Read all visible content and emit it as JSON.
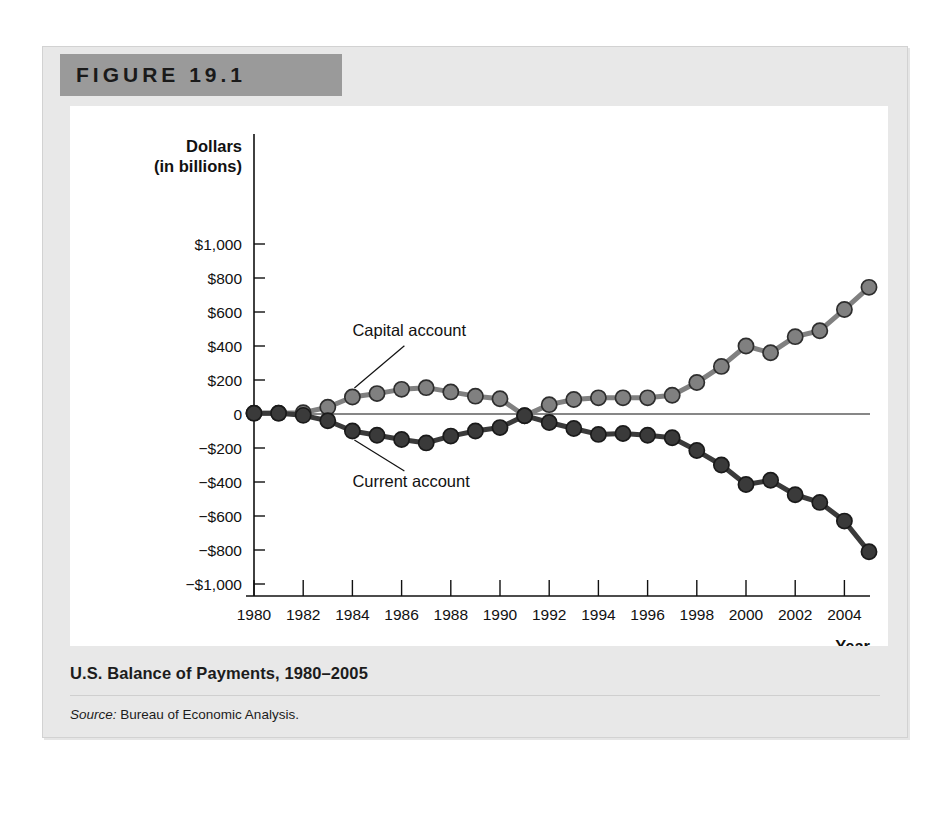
{
  "figure": {
    "header_label": "FIGURE 19.1",
    "caption_title": "U.S. Balance of Payments, 1980–2005",
    "source_prefix": "Source:",
    "source_text": "Bureau of Economic Analysis."
  },
  "chart_data": {
    "type": "line",
    "title": "U.S. Balance of Payments, 1980–2005",
    "xlabel": "Year",
    "ylabel": "Dollars (in billions)",
    "ylabel_line1": "Dollars",
    "ylabel_line2": "(in billions)",
    "xlim": [
      1980,
      2005
    ],
    "ylim": [
      -1000,
      1000
    ],
    "grid": false,
    "legend_position": "inline-annotations",
    "y_ticks": [
      1000,
      800,
      600,
      400,
      200,
      0,
      -200,
      -400,
      -600,
      -800,
      -1000
    ],
    "y_tick_labels": [
      "$1,000",
      "$800",
      "$600",
      "$400",
      "$200",
      "0",
      "−$200",
      "−$400",
      "−$600",
      "−$800",
      "−$1,000"
    ],
    "x_ticks": [
      1980,
      1982,
      1984,
      1986,
      1988,
      1990,
      1992,
      1994,
      1996,
      1998,
      2000,
      2002,
      2004
    ],
    "x_tick_labels": [
      "1980",
      "1982",
      "1984",
      "1986",
      "1988",
      "1990",
      "1992",
      "1994",
      "1996",
      "1998",
      "2000",
      "2002",
      "2004"
    ],
    "x": [
      1980,
      1981,
      1982,
      1983,
      1984,
      1985,
      1986,
      1987,
      1988,
      1989,
      1990,
      1991,
      1992,
      1993,
      1994,
      1995,
      1996,
      1997,
      1998,
      1999,
      2000,
      2001,
      2002,
      2003,
      2004,
      2005
    ],
    "series": [
      {
        "name": "Capital account",
        "color": "#808080",
        "marker_edge": "#2e2e2e",
        "values": [
          5,
          5,
          8,
          40,
          100,
          120,
          145,
          155,
          130,
          105,
          90,
          -10,
          55,
          85,
          95,
          95,
          95,
          110,
          185,
          280,
          400,
          360,
          455,
          490,
          615,
          745
        ]
      },
      {
        "name": "Current account",
        "color": "#3a3a3a",
        "marker_edge": "#1a1a1a",
        "values": [
          5,
          5,
          -8,
          -40,
          -100,
          -125,
          -150,
          -170,
          -130,
          -100,
          -80,
          -10,
          -50,
          -85,
          -120,
          -115,
          -125,
          -140,
          -215,
          -300,
          -415,
          -390,
          -475,
          -520,
          -630,
          -810
        ]
      }
    ],
    "annotations": [
      {
        "text": "Capital account",
        "x": 1984,
        "y": 460
      },
      {
        "text": "Current account",
        "x": 1984,
        "y": -430
      }
    ]
  }
}
